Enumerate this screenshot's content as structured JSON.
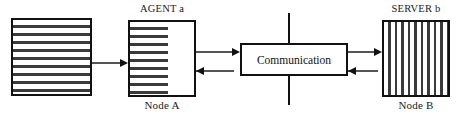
{
  "diagram": {
    "nodes": {
      "data_block": {
        "name": "data-block",
        "label": "",
        "pattern": "horizontal-stripes"
      },
      "agent": {
        "top_label": "AGENT a",
        "bottom_label": "Node A",
        "pattern": "horizontal-stripes"
      },
      "communication": {
        "label": "Communication",
        "pattern": "plain"
      },
      "server": {
        "top_label": "SERVER b",
        "bottom_label": "Node B",
        "pattern": "vertical-stripes"
      }
    },
    "connectors": [
      {
        "id": "data-to-agent",
        "direction": "right",
        "from": "data-block",
        "to": "agent"
      },
      {
        "id": "agent-to-comm",
        "direction": "right",
        "from": "agent",
        "to": "communication"
      },
      {
        "id": "comm-to-agent",
        "direction": "left",
        "from": "communication",
        "to": "agent"
      },
      {
        "id": "comm-to-server",
        "direction": "right",
        "from": "communication",
        "to": "server"
      },
      {
        "id": "server-to-comm",
        "direction": "left",
        "from": "server",
        "to": "communication"
      }
    ],
    "divider": {
      "name": "node-boundary-line",
      "orientation": "vertical"
    },
    "colors": {
      "stroke": "#111111",
      "stripe": "#3a3a3a",
      "connector": "#555555",
      "background": "#ffffff"
    }
  }
}
